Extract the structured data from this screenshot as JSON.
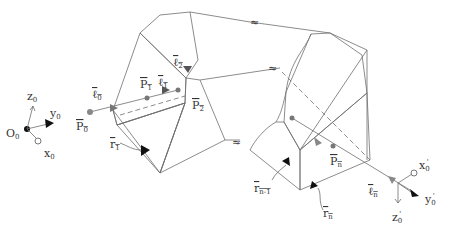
{
  "diagram": {
    "type": "multi-segment tube / ray path through prism cross-sections",
    "origin_frame": {
      "origin": "O",
      "origin_sub": "0",
      "axes": [
        {
          "name": "z",
          "sub": "0"
        },
        {
          "name": "y",
          "sub": "0"
        },
        {
          "name": "x",
          "sub": "0"
        }
      ]
    },
    "end_frame": {
      "axes": [
        {
          "name": "x",
          "sub": "0",
          "prime": "'"
        },
        {
          "name": "y",
          "sub": "0",
          "prime": "'"
        },
        {
          "name": "z",
          "sub": "0",
          "prime": "'"
        }
      ]
    },
    "points": [
      {
        "name": "P",
        "sub": "0"
      },
      {
        "name": "P",
        "sub": "1"
      },
      {
        "name": "P",
        "sub": "2"
      },
      {
        "name": "P",
        "sub": "n"
      }
    ],
    "rays": [
      {
        "name": "ℓ",
        "sub": "0"
      },
      {
        "name": "ℓ",
        "sub": "1"
      },
      {
        "name": "ℓ",
        "sub": "2"
      },
      {
        "name": "ℓ",
        "sub": "n"
      }
    ],
    "normals": [
      {
        "name": "r",
        "sub": "1"
      },
      {
        "name": "r",
        "sub": "n-1"
      },
      {
        "name": "r",
        "sub": "n"
      }
    ],
    "break_symbol": "≈",
    "colors": {
      "stroke": "#6e6e6e",
      "face_light": "#eeeeee",
      "face_mid": "#d6d6d6",
      "face_dark": "#6a6a6a",
      "text": "#333333"
    }
  }
}
